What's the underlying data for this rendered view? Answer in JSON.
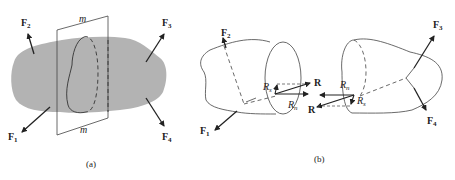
{
  "figure": {
    "panel_a": {
      "caption": "(a)",
      "plane_label_top": "m",
      "plane_label_bottom": "m",
      "forces": [
        {
          "name": "F",
          "sub": "1"
        },
        {
          "name": "F",
          "sub": "2"
        },
        {
          "name": "F",
          "sub": "3"
        },
        {
          "name": "F",
          "sub": "4"
        }
      ],
      "body_color": "#b3b3b3"
    },
    "panel_b": {
      "caption": "(b)",
      "left_part": {
        "forces": [
          {
            "name": "F",
            "sub": "1"
          },
          {
            "name": "F",
            "sub": "2"
          }
        ],
        "resultant": "R",
        "normal": {
          "name": "R",
          "sub": "n"
        },
        "shear": {
          "name": "R",
          "sub": "s"
        }
      },
      "right_part": {
        "forces": [
          {
            "name": "F",
            "sub": "3"
          },
          {
            "name": "F",
            "sub": "4"
          }
        ],
        "resultant": "R",
        "normal": {
          "name": "R",
          "sub": "n"
        },
        "shear": {
          "name": "R",
          "sub": "s"
        }
      }
    }
  }
}
